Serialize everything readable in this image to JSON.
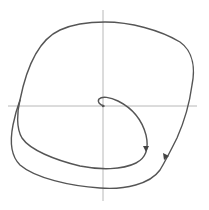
{
  "diagram": {
    "type": "phase-portrait",
    "axes": {
      "x_axis": {
        "label": ""
      },
      "y_axis": {
        "label": ""
      }
    },
    "elements": [
      {
        "name": "limit-cycle",
        "kind": "closed-orbit",
        "direction": "clockwise"
      },
      {
        "name": "spiral-trajectory",
        "kind": "trajectory",
        "start": "origin",
        "approaches": "limit-cycle"
      }
    ],
    "arrows": 2,
    "colors": {
      "background": "#ffffff",
      "axes": "#b8b8b8",
      "curves": "#555555",
      "arrowheads": "#444444"
    }
  }
}
